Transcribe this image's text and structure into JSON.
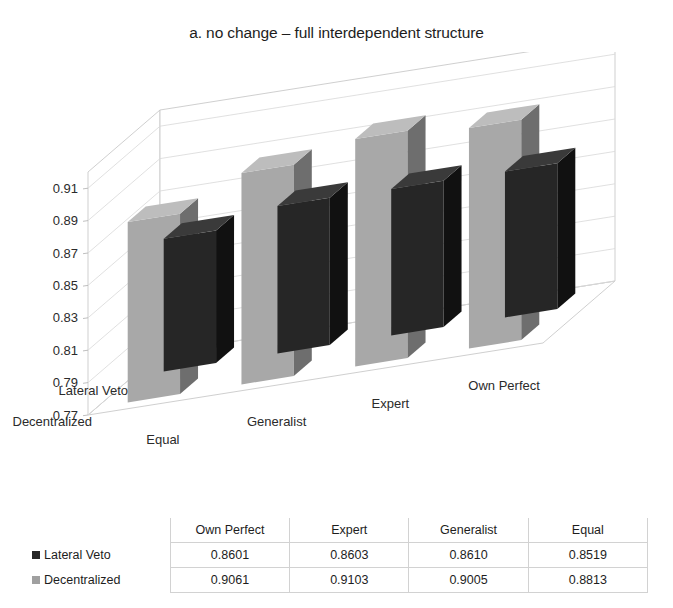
{
  "chart_data": {
    "type": "bar",
    "subtype": "3d-grouped-column",
    "title": "a. no change – full interdependent structure",
    "categories": [
      "Equal",
      "Generalist",
      "Expert",
      "Own Perfect"
    ],
    "series": [
      {
        "name": "Lateral Veto",
        "color": "#262626",
        "side_color": "#111111",
        "top_color": "#3a3a3a",
        "values": [
          0.8519,
          0.861,
          0.8603,
          0.8601
        ]
      },
      {
        "name": "Decentralized",
        "color": "#a8a8a8",
        "side_color": "#6e6e6e",
        "top_color": "#bdbdbd",
        "values": [
          0.8813,
          0.9005,
          0.9103,
          0.9061
        ]
      }
    ],
    "xlabel": "",
    "ylabel": "",
    "zlabel": "",
    "ylim": [
      0.77,
      0.92
    ],
    "yticks": [
      "0.77",
      "0.79",
      "0.81",
      "0.83",
      "0.85",
      "0.87",
      "0.89",
      "0.91"
    ],
    "ytick_values": [
      0.77,
      0.79,
      0.81,
      0.83,
      0.85,
      0.87,
      0.89,
      0.91
    ],
    "grid": true,
    "legend_position": "table-below",
    "depth_categories": [
      "Lateral Veto",
      "Decentralized"
    ]
  },
  "table": {
    "corner": "",
    "columns": [
      "Own Perfect",
      "Expert",
      "Generalist",
      "Equal"
    ],
    "rows": [
      {
        "label": "Lateral Veto",
        "swatch": "#262626",
        "values": [
          "0.8601",
          "0.8603",
          "0.8610",
          "0.8519"
        ]
      },
      {
        "label": "Decentralized",
        "swatch": "#a0a0a0",
        "values": [
          "0.9061",
          "0.9103",
          "0.9005",
          "0.8813"
        ]
      }
    ]
  }
}
